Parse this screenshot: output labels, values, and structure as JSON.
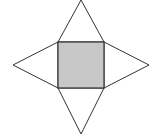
{
  "diagram": {
    "type": "pyramid-net",
    "colors": {
      "background": "#ffffff",
      "base_fill": "#c8c8c8",
      "stroke": "#333333",
      "triangle_fill": "#ffffff"
    },
    "base": {
      "x1": 58,
      "y1": 42,
      "x2": 104,
      "y2": 88
    },
    "apexes": {
      "top": [
        81,
        0
      ],
      "bottom": [
        81,
        134
      ],
      "left": [
        13,
        65
      ],
      "right": [
        149,
        65
      ]
    }
  }
}
